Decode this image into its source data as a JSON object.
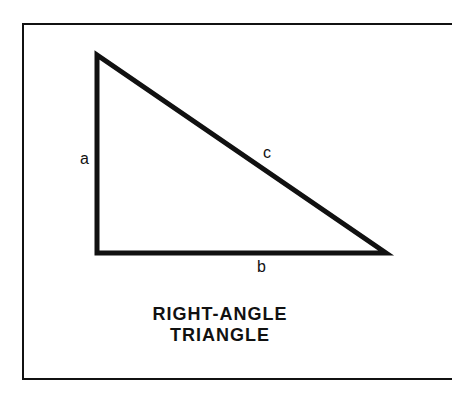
{
  "diagram": {
    "title_line1": "RIGHT-ANGLE",
    "title_line2": "TRIANGLE",
    "sides": {
      "a": "a",
      "b": "b",
      "c": "c"
    },
    "vertices": {
      "top": [
        97,
        55
      ],
      "right_angle": [
        97,
        253
      ],
      "right": [
        386,
        253
      ]
    },
    "stroke_color": "#111111"
  }
}
